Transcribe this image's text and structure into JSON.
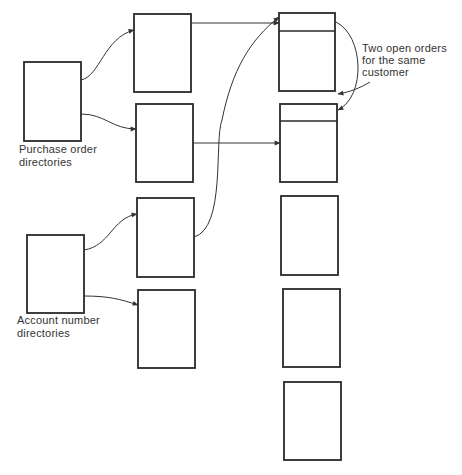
{
  "colors": {
    "stroke": "#2a2a2a",
    "background": "#ffffff",
    "text": "#333333"
  },
  "labels": {
    "purchase_order": [
      "Purchase order",
      "directories"
    ],
    "account_number": [
      "Account number",
      "directories"
    ],
    "annotation": [
      "Two open orders",
      "for the same",
      "customer"
    ]
  },
  "nodes": {
    "directories": [
      {
        "id": "purchase-order-directory",
        "x": 24,
        "y": 62,
        "w": 57,
        "h": 79
      },
      {
        "id": "account-number-directory",
        "x": 27,
        "y": 235,
        "w": 57,
        "h": 78
      }
    ],
    "index_blocks": [
      {
        "id": "index-block-1",
        "x": 134,
        "y": 14,
        "w": 57,
        "h": 78
      },
      {
        "id": "index-block-2",
        "x": 136,
        "y": 104,
        "w": 57,
        "h": 78
      },
      {
        "id": "index-block-3",
        "x": 137,
        "y": 198,
        "w": 57,
        "h": 79
      },
      {
        "id": "index-block-4",
        "x": 138,
        "y": 290,
        "w": 57,
        "h": 78
      }
    ],
    "order_records": [
      {
        "id": "order-record-1",
        "x": 279,
        "y": 13,
        "w": 56,
        "h": 78,
        "header_y": 31
      },
      {
        "id": "order-record-2",
        "x": 280,
        "y": 104,
        "w": 57,
        "h": 78,
        "header_y": 121
      },
      {
        "id": "order-record-3",
        "x": 281,
        "y": 196,
        "w": 57,
        "h": 79
      },
      {
        "id": "order-record-4",
        "x": 283,
        "y": 289,
        "w": 57,
        "h": 78
      },
      {
        "id": "order-record-5",
        "x": 284,
        "y": 382,
        "w": 57,
        "h": 78
      }
    ]
  }
}
